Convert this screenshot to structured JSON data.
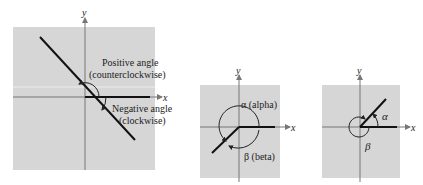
{
  "colors": {
    "panel_fill": "#d6d6d6",
    "axis": "#777777",
    "ray": "#111111",
    "text": "#222222"
  },
  "figures": [
    {
      "id": "positive-negative-angles",
      "axis_labels": {
        "x": "x",
        "y": "y"
      },
      "annotations": {
        "positive_line1": "Positive angle",
        "positive_line2": "(counterclockwise)",
        "negative_line1": "Negative angle",
        "negative_line2": "(clockwise)"
      }
    },
    {
      "id": "coterminal-alpha-beta",
      "axis_labels": {
        "x": "x",
        "y": "y"
      },
      "annotations": {
        "alpha": "α (alpha)",
        "beta": "β (beta)"
      }
    },
    {
      "id": "coterminal-first-quadrant",
      "axis_labels": {
        "x": "x",
        "y": "y"
      },
      "annotations": {
        "alpha": "α",
        "beta": "β"
      }
    }
  ]
}
